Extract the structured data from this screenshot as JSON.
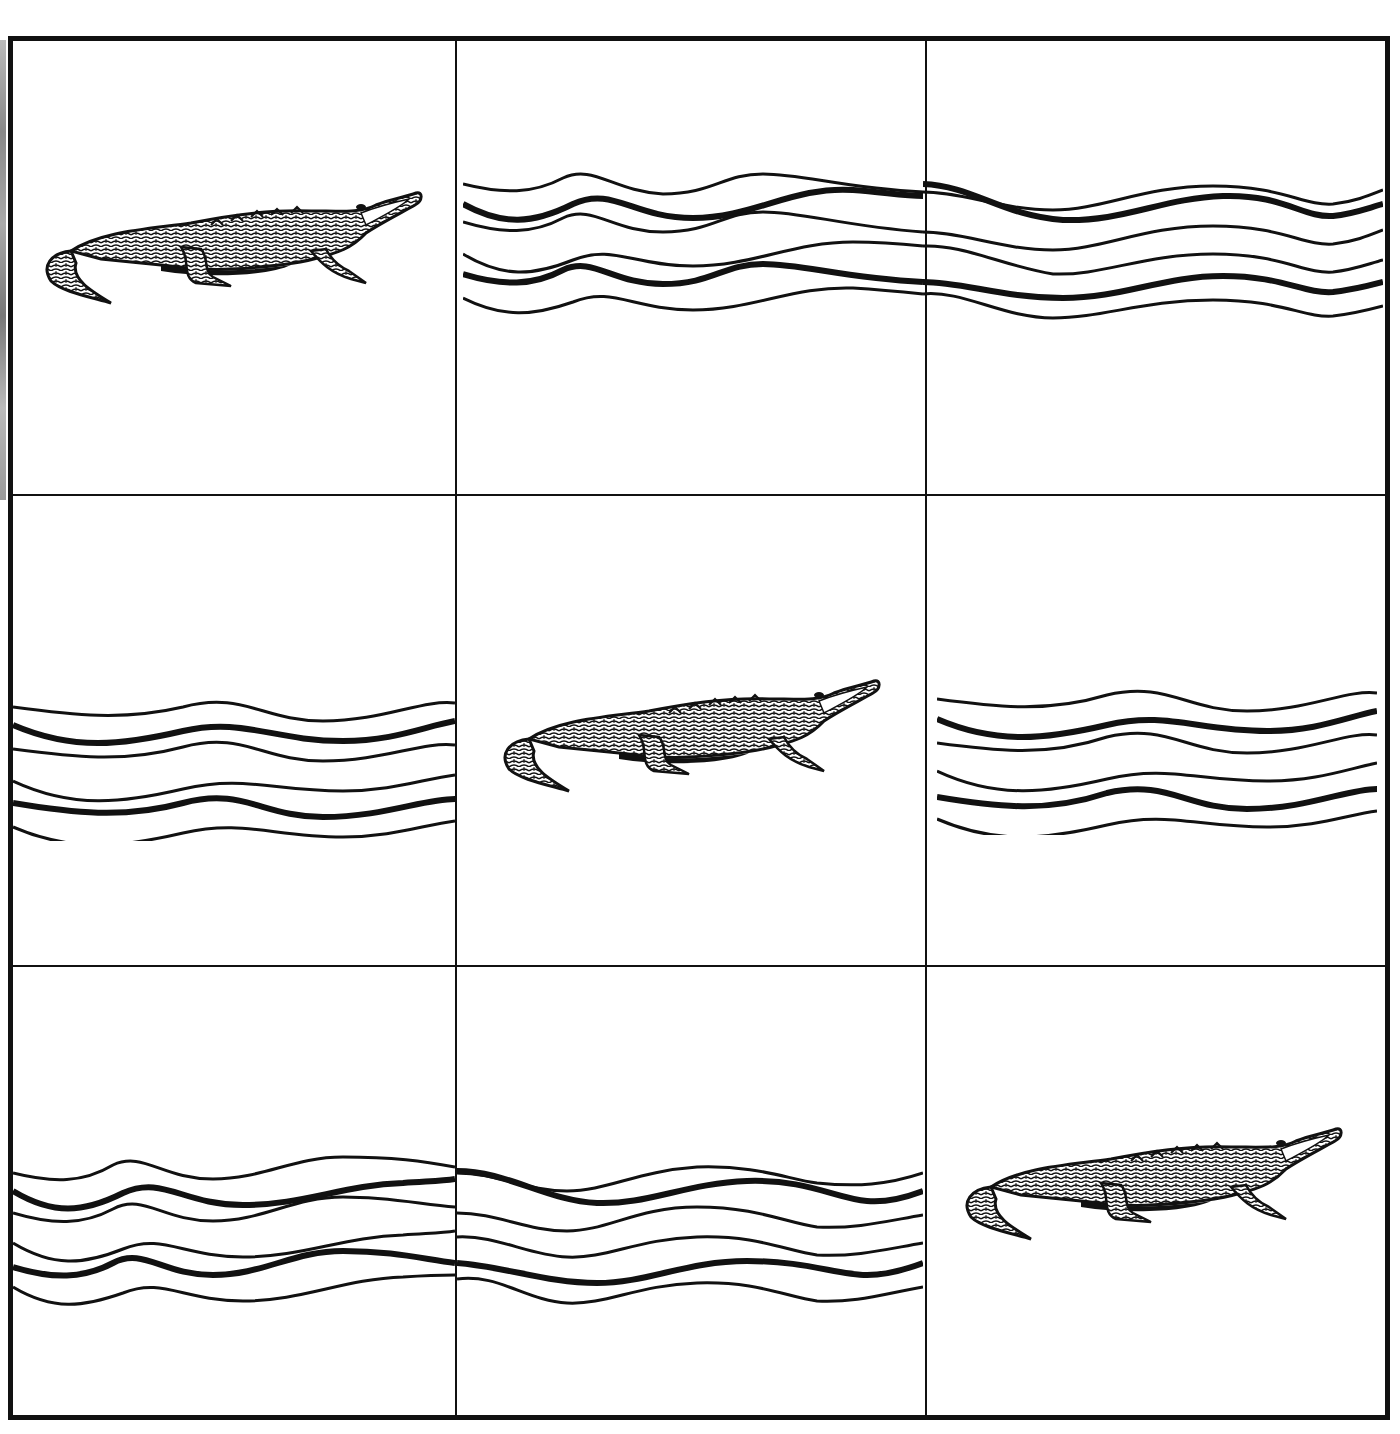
{
  "puzzle": {
    "type": "grid-tile-puzzle",
    "rows": 3,
    "cols": 3,
    "colors": {
      "ink": "#111111",
      "background": "#ffffff"
    },
    "grid": [
      [
        "alligator",
        "water",
        "water"
      ],
      [
        "water",
        "alligator",
        "water"
      ],
      [
        "water",
        "water",
        "alligator"
      ]
    ],
    "cells": [
      {
        "row": 0,
        "col": 0,
        "content": "alligator",
        "icon": "alligator-icon"
      },
      {
        "row": 0,
        "col": 1,
        "content": "water",
        "icon": "water-waves-icon"
      },
      {
        "row": 0,
        "col": 2,
        "content": "water",
        "icon": "water-waves-icon"
      },
      {
        "row": 1,
        "col": 0,
        "content": "water",
        "icon": "water-waves-icon"
      },
      {
        "row": 1,
        "col": 1,
        "content": "alligator",
        "icon": "alligator-icon"
      },
      {
        "row": 1,
        "col": 2,
        "content": "water",
        "icon": "water-waves-icon"
      },
      {
        "row": 2,
        "col": 0,
        "content": "water",
        "icon": "water-waves-icon"
      },
      {
        "row": 2,
        "col": 1,
        "content": "water",
        "icon": "water-waves-icon"
      },
      {
        "row": 2,
        "col": 2,
        "content": "alligator",
        "icon": "alligator-icon"
      }
    ]
  }
}
